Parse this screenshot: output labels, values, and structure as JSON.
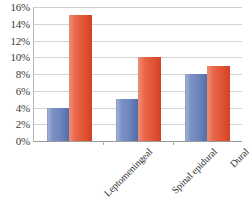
{
  "chart_data": {
    "type": "bar",
    "title": "",
    "subtitle": "",
    "xlabel": "",
    "ylabel": "",
    "categories": [
      "Leptomeningeal",
      "Spinal epidural",
      "Dural"
    ],
    "series": [
      {
        "name": "Series 1",
        "color": "#6e86bd",
        "values": [
          4,
          5,
          8
        ]
      },
      {
        "name": "Series 2",
        "color": "#e8644a",
        "values": [
          15,
          10,
          9
        ]
      }
    ],
    "ylim": [
      0,
      16
    ],
    "ytick_step": 2,
    "ytick_labels": [
      "0%",
      "2%",
      "4%",
      "6%",
      "8%",
      "10%",
      "12%",
      "14%",
      "16%"
    ],
    "ytick_values": [
      0,
      2,
      4,
      6,
      8,
      10,
      12,
      14,
      16
    ],
    "value_suffix": "%",
    "grid": true,
    "grid_axis": "y",
    "legend": false,
    "legend_position": "none",
    "background_color": "#ffffff",
    "gridline_color": "#d4d4d4",
    "axis_color": "#9a9a9a",
    "tick_label_color": "#3a3a3a",
    "label_rotation_deg": -45
  }
}
